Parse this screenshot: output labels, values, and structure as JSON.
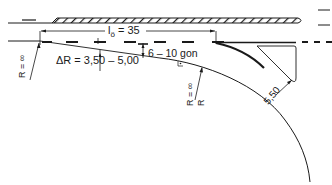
{
  "diagram": {
    "type": "road-lane-taper-engineering-drawing",
    "labels": {
      "length": "lö = 35",
      "length_symbol": "l",
      "length_subscript": "ö",
      "length_value": "= 35",
      "delta_r": "ΔR = 3,50 – 5,00",
      "angle": "6 – 10 gon",
      "radius_left": "R = ∞",
      "radius_right_top": "R = ∞",
      "radius_right_bottom": "R",
      "width": "5,50"
    },
    "colors": {
      "line": "#1a1a1a",
      "background": "#ffffff"
    }
  }
}
